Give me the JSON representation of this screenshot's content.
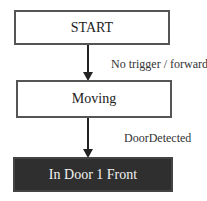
{
  "diagram": {
    "type": "state-flowchart",
    "nodes": [
      {
        "id": "start",
        "label": "START",
        "style": "outline"
      },
      {
        "id": "moving",
        "label": "Moving",
        "style": "outline"
      },
      {
        "id": "in_door_1_front",
        "label": "In Door 1 Front",
        "style": "filled-dark"
      }
    ],
    "edges": [
      {
        "from": "start",
        "to": "moving",
        "label": "No trigger / forward"
      },
      {
        "from": "moving",
        "to": "in_door_1_front",
        "label": "DoorDetected"
      }
    ]
  }
}
